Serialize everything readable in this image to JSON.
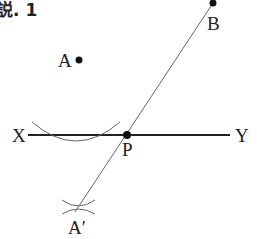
{
  "figure": {
    "title": "説. 1",
    "points": {
      "A": {
        "label": "A",
        "x": 79,
        "y": 60
      },
      "B": {
        "label": "B",
        "x": 213,
        "y": 3
      },
      "P": {
        "label": "P",
        "x": 127,
        "y": 135
      },
      "A_prime": {
        "label": "A′",
        "x": 78,
        "y": 208
      }
    },
    "line_XY": {
      "start_label": "X",
      "end_label": "Y",
      "x1": 28,
      "x2": 230,
      "y": 135
    },
    "colors": {
      "ink": "#222222",
      "thin_line": "#666666"
    }
  }
}
